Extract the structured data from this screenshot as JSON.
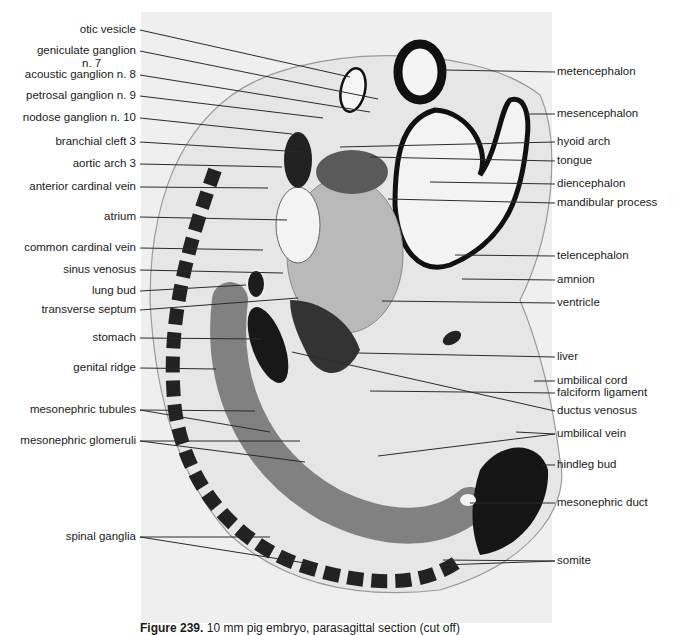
{
  "figure": {
    "caption_label": "Figure 239.",
    "caption_text": "10 mm pig embryo, parasagittal section (cut off)",
    "left_labels": [
      {
        "text": "otic vesicle",
        "x": 140,
        "y": 30,
        "tx": 350,
        "ty": 77
      },
      {
        "text": "geniculate ganglion",
        "x": 140,
        "y": 51,
        "tx": 378,
        "ty": 99
      },
      {
        "text": "n. 7",
        "x": 82,
        "y": 64,
        "tx": null,
        "ty": null
      },
      {
        "text": "acoustic ganglion n. 8",
        "x": 140,
        "y": 75,
        "tx": 370,
        "ty": 112
      },
      {
        "text": "petrosal ganglion n. 9",
        "x": 140,
        "y": 96,
        "tx": 323,
        "ty": 118
      },
      {
        "text": "nodose ganglion n. 10",
        "x": 140,
        "y": 118,
        "tx": 292,
        "ty": 134
      },
      {
        "text": "branchial cleft 3",
        "x": 140,
        "y": 142,
        "tx": 303,
        "ty": 152
      },
      {
        "text": "aortic arch 3",
        "x": 140,
        "y": 164,
        "tx": 282,
        "ty": 167
      },
      {
        "text": "anterior cardinal vein",
        "x": 140,
        "y": 187,
        "tx": 268,
        "ty": 188
      },
      {
        "text": "atrium",
        "x": 140,
        "y": 217,
        "tx": 287,
        "ty": 220
      },
      {
        "text": "common cardinal vein",
        "x": 140,
        "y": 248,
        "tx": 263,
        "ty": 250
      },
      {
        "text": "sinus venosus",
        "x": 140,
        "y": 270,
        "tx": 283,
        "ty": 273
      },
      {
        "text": "lung bud",
        "x": 140,
        "y": 291,
        "tx": 246,
        "ty": 285
      },
      {
        "text": "transverse septum",
        "x": 140,
        "y": 310,
        "tx": 298,
        "ty": 298
      },
      {
        "text": "stomach",
        "x": 140,
        "y": 338,
        "tx": 262,
        "ty": 339
      },
      {
        "text": "genital ridge",
        "x": 140,
        "y": 368,
        "tx": 216,
        "ty": 369
      },
      {
        "text": "mesonephric tubules",
        "x": 140,
        "y": 410,
        "tx": 255,
        "ty": 411,
        "tx2": 270,
        "ty2": 432
      },
      {
        "text": "mesonephric glomeruli",
        "x": 140,
        "y": 441,
        "tx": 300,
        "ty": 441,
        "tx2": 305,
        "ty2": 462
      },
      {
        "text": "spinal ganglia",
        "x": 140,
        "y": 537,
        "tx": 270,
        "ty": 537,
        "tx2": 305,
        "ty2": 563
      }
    ],
    "right_labels": [
      {
        "text": "metencephalon",
        "x": 555,
        "y": 72,
        "tx": 445,
        "ty": 70
      },
      {
        "text": "mesencephalon",
        "x": 555,
        "y": 114,
        "tx": 527,
        "ty": 114
      },
      {
        "text": "hyoid arch",
        "x": 555,
        "y": 142,
        "tx": 340,
        "ty": 147
      },
      {
        "text": "tongue",
        "x": 555,
        "y": 161,
        "tx": 370,
        "ty": 157
      },
      {
        "text": "diencephalon",
        "x": 555,
        "y": 184,
        "tx": 430,
        "ty": 182
      },
      {
        "text": "mandibular process",
        "x": 555,
        "y": 203,
        "tx": 388,
        "ty": 199
      },
      {
        "text": "telencephalon",
        "x": 555,
        "y": 256,
        "tx": 455,
        "ty": 255
      },
      {
        "text": "amnion",
        "x": 555,
        "y": 280,
        "tx": 462,
        "ty": 279
      },
      {
        "text": "ventricle",
        "x": 555,
        "y": 303,
        "tx": 382,
        "ty": 301
      },
      {
        "text": "liver",
        "x": 555,
        "y": 357,
        "tx": 358,
        "ty": 353
      },
      {
        "text": "umbilical cord",
        "x": 555,
        "y": 381,
        "tx": 534,
        "ty": 381
      },
      {
        "text": "falciform ligament",
        "x": 555,
        "y": 393,
        "tx": 370,
        "ty": 391
      },
      {
        "text": "ductus venosus",
        "x": 555,
        "y": 411,
        "tx": 292,
        "ty": 352
      },
      {
        "text": "umbilical vein",
        "x": 555,
        "y": 434,
        "tx": 378,
        "ty": 456,
        "tx2": 516,
        "ty2": 432
      },
      {
        "text": "hindleg bud",
        "x": 555,
        "y": 465,
        "tx": 541,
        "ty": 465
      },
      {
        "text": "mesonephric duct",
        "x": 555,
        "y": 503,
        "tx": 470,
        "ty": 503
      },
      {
        "text": "somite",
        "x": 555,
        "y": 561,
        "tx": 443,
        "ty": 560,
        "tx2": 443,
        "ty2": 565
      }
    ]
  },
  "colors": {
    "photo_background": "#efefef",
    "page_background": "#ffffff",
    "label_text": "#1a1a1a",
    "leader_line": "#2b2b2b",
    "tissue_dark": "#111111",
    "tissue_mid": "#7a7a7a",
    "tissue_light": "#c9c9c9"
  }
}
